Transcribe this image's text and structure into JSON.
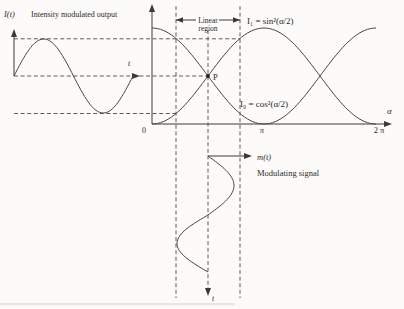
{
  "figure": {
    "ink": "#3a3a3a",
    "background": "#fcfbf9",
    "left_plot": {
      "axis_label": "I(t)",
      "title": "Intensity modulated output",
      "time_label": "t"
    },
    "main_plot": {
      "curve1_label": "I₁ = sin²(α/2)",
      "curve0_label": "I₀ = cos²(α/2)",
      "x_axis_label": "α",
      "x_ticks": [
        "0",
        "π",
        "2 π"
      ],
      "point_label": "P",
      "linear_region_line1": "Linear",
      "linear_region_line2": "region"
    },
    "modulating": {
      "signal_label": "m(t)",
      "caption": "Modulating signal",
      "time_label": "t"
    }
  },
  "chart_data": [
    {
      "type": "line",
      "title": "Electro-optic modulator transfer characteristics",
      "xlabel": "α",
      "ylabel": "normalized intensity",
      "x_range": [
        0,
        6.2832
      ],
      "y_range": [
        0,
        1
      ],
      "x_ticks": [
        {
          "value": 0,
          "label": "0"
        },
        {
          "value": 3.1416,
          "label": "π"
        },
        {
          "value": 6.2832,
          "label": "2 π"
        }
      ],
      "grid": false,
      "series": [
        {
          "name": "I₁ = sin²(α/2)",
          "formula": "sin^2(alpha/2)",
          "points": [
            [
              0,
              0
            ],
            [
              0.7854,
              0.1464
            ],
            [
              1.5708,
              0.5
            ],
            [
              2.3562,
              0.8536
            ],
            [
              3.1416,
              1
            ],
            [
              3.927,
              0.8536
            ],
            [
              4.7124,
              0.5
            ],
            [
              5.4978,
              0.1464
            ],
            [
              6.2832,
              0
            ]
          ]
        },
        {
          "name": "I₀ = cos²(α/2)",
          "formula": "cos^2(alpha/2)",
          "points": [
            [
              0,
              1
            ],
            [
              0.7854,
              0.8536
            ],
            [
              1.5708,
              0.5
            ],
            [
              2.3562,
              0.1464
            ],
            [
              3.1416,
              0
            ],
            [
              3.927,
              0.1464
            ],
            [
              4.7124,
              0.5
            ],
            [
              5.4978,
              0.8536
            ],
            [
              6.2832,
              1
            ]
          ]
        }
      ],
      "annotations": [
        {
          "label": "P",
          "x": 1.5708,
          "y": 0.5,
          "note": "bias point at curve crossing"
        },
        {
          "label": "Linear region",
          "x_range": [
            0.67,
            2.47
          ],
          "note": "operating span marked by vertical dashed lines"
        }
      ]
    },
    {
      "type": "line",
      "title": "Intensity modulated output",
      "axes": "I(t) versus t (time rightward)",
      "description": "one sine cycle centred on the bias level; peaks touch the dashed levels set by the linear-region limits"
    },
    {
      "type": "line",
      "title": "Modulating signal",
      "axes": "m(t) versus t (time downward)",
      "description": "one sine cycle applied about the bias point P, swinging α across the linear region"
    }
  ]
}
